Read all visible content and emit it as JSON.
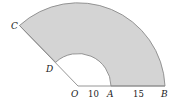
{
  "diagram": {
    "type": "annular-sector",
    "colors": {
      "fill": "#d4d4d4",
      "stroke": "#8a8a8a",
      "text": "#222222",
      "background": "#ffffff"
    },
    "points": {
      "O": {
        "label": "O"
      },
      "A": {
        "label": "A"
      },
      "B": {
        "label": "B"
      },
      "C": {
        "label": "C"
      },
      "D": {
        "label": "D"
      }
    },
    "measures": {
      "OA": "10",
      "AB": "15"
    }
  }
}
